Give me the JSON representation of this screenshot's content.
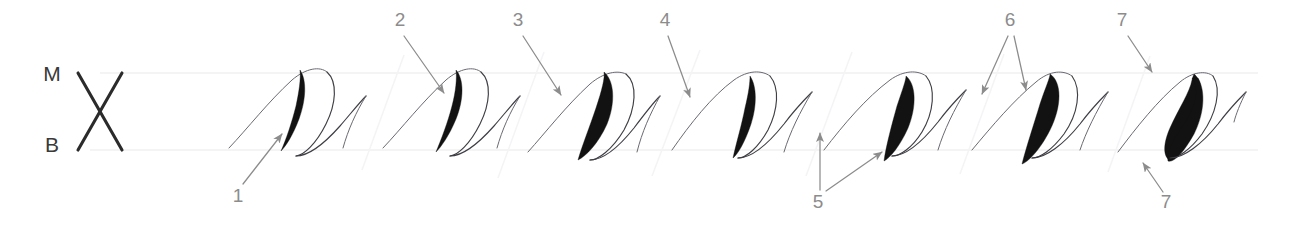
{
  "plate": {
    "title": "Shaded Downstroke Penmanship Exercise",
    "background_color": "#ffffff",
    "ink_color": "#121212",
    "hairline_color": "#3e3e44",
    "guideline_color": "#f0f0f2",
    "callout_color": "#8c8c8c"
  },
  "guides": {
    "top_label": "M",
    "bottom_label": "B",
    "top_label_meaning": "midline",
    "bottom_label_meaning": "baseline",
    "top_rule_y": 73,
    "bottom_rule_y": 150,
    "slant_mark": "X"
  },
  "callouts": [
    {
      "id": "c1",
      "label": "1",
      "x": 238,
      "y": 202,
      "position": "below",
      "target_x": 283,
      "target_y": 132,
      "arrows": 1
    },
    {
      "id": "c2",
      "label": "2",
      "x": 400,
      "y": 22,
      "position": "above",
      "target_x": 446,
      "target_y": 95,
      "arrows": 1
    },
    {
      "id": "c3",
      "label": "3",
      "x": 518,
      "y": 22,
      "position": "above",
      "target_x": 562,
      "target_y": 97,
      "arrows": 1
    },
    {
      "id": "c4",
      "label": "4",
      "x": 665,
      "y": 22,
      "position": "above",
      "target_x": 690,
      "target_y": 99,
      "arrows": 1
    },
    {
      "id": "c5",
      "label": "5",
      "x": 818,
      "y": 208,
      "position": "below",
      "target_x": 851,
      "target_y": 148,
      "arrows": 2
    },
    {
      "id": "c6",
      "label": "6",
      "x": 1010,
      "y": 22,
      "position": "above",
      "target_x": 1028,
      "target_y": 92,
      "arrows": 2
    },
    {
      "id": "c7",
      "label": "7",
      "x": 1122,
      "y": 22,
      "position": "above",
      "target_x": 1150,
      "target_y": 74,
      "arrows": 1
    },
    {
      "id": "c7b",
      "label": "7",
      "x": 1166,
      "y": 206,
      "position": "below",
      "target_x": 1145,
      "target_y": 160,
      "arrows": 1
    }
  ],
  "strokes": [
    {
      "id": "s1",
      "index": 1,
      "name": "stroke-group-1",
      "shade_style": "tapered-both-ends",
      "shade_weight": "medium"
    },
    {
      "id": "s2",
      "index": 2,
      "name": "stroke-group-2",
      "shade_style": "tapered-both-ends",
      "shade_weight": "medium"
    },
    {
      "id": "s3",
      "index": 3,
      "name": "stroke-group-3",
      "shade_style": "broad-oval",
      "shade_weight": "heavy"
    },
    {
      "id": "s4",
      "index": 4,
      "name": "stroke-group-4",
      "shade_style": "narrow-upright",
      "shade_weight": "medium"
    },
    {
      "id": "s5",
      "index": 5,
      "name": "stroke-group-5",
      "shade_style": "pointed-foot",
      "shade_weight": "heavy"
    },
    {
      "id": "s6",
      "index": 6,
      "name": "stroke-group-6",
      "shade_style": "leaf-blade",
      "shade_weight": "heavy"
    },
    {
      "id": "s7",
      "index": 7,
      "name": "stroke-group-7",
      "shade_style": "s-curve-blunt",
      "shade_weight": "heavy"
    }
  ]
}
